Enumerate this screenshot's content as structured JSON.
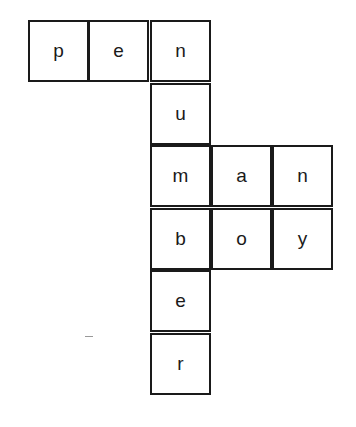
{
  "puzzle": {
    "type": "crossword-letter-grid",
    "words": [
      "pen",
      "number",
      "man",
      "boy"
    ],
    "cells": [
      {
        "letter": "p",
        "row": 0,
        "col": 0
      },
      {
        "letter": "e",
        "row": 0,
        "col": 1
      },
      {
        "letter": "n",
        "row": 0,
        "col": 2
      },
      {
        "letter": "u",
        "row": 1,
        "col": 2
      },
      {
        "letter": "m",
        "row": 2,
        "col": 2
      },
      {
        "letter": "a",
        "row": 2,
        "col": 3
      },
      {
        "letter": "n",
        "row": 2,
        "col": 4
      },
      {
        "letter": "b",
        "row": 3,
        "col": 2
      },
      {
        "letter": "o",
        "row": 3,
        "col": 3
      },
      {
        "letter": "y",
        "row": 3,
        "col": 4
      },
      {
        "letter": "e",
        "row": 4,
        "col": 2
      },
      {
        "letter": "r",
        "row": 5,
        "col": 2
      }
    ]
  }
}
